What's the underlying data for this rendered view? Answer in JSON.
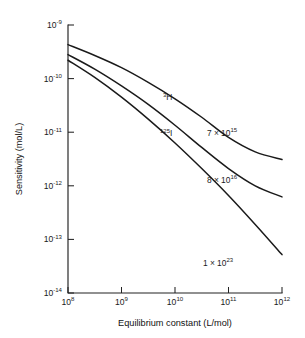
{
  "chart_data": {
    "type": "line",
    "title": "",
    "xlabel": "Equilibrium constant (L/mol)",
    "ylabel": "Sensitivity (mol/L)",
    "xscale": "log",
    "yscale": "log",
    "xlim": [
      100000000.0,
      1000000000000.0
    ],
    "ylim": [
      1e-14,
      1e-09
    ],
    "grid": false,
    "legend": "inline-annotations",
    "xticks": [
      {
        "value": 100000000.0,
        "mantissa": "10",
        "exponent": "8"
      },
      {
        "value": 1000000000.0,
        "mantissa": "10",
        "exponent": "9"
      },
      {
        "value": 10000000000.0,
        "mantissa": "10",
        "exponent": "10"
      },
      {
        "value": 100000000000.0,
        "mantissa": "10",
        "exponent": "11"
      },
      {
        "value": 1000000000000.0,
        "mantissa": "10",
        "exponent": "12"
      }
    ],
    "yticks": [
      {
        "value": 1e-09,
        "mantissa": "10",
        "exponent": "-9"
      },
      {
        "value": 1e-10,
        "mantissa": "10",
        "exponent": "-10"
      },
      {
        "value": 1e-11,
        "mantissa": "10",
        "exponent": "-11"
      },
      {
        "value": 1e-12,
        "mantissa": "10",
        "exponent": "-12"
      },
      {
        "value": 1e-13,
        "mantissa": "10",
        "exponent": "-13"
      },
      {
        "value": 1e-14,
        "mantissa": "10",
        "exponent": "-14"
      }
    ],
    "series": [
      {
        "name": "3H",
        "label_isotope_sup": "3",
        "label_isotope_el": "H",
        "specific_activity_mantissa": "7",
        "specific_activity_exponent": "15",
        "specific_activity_text": "7 × 10",
        "x": [
          100000000.0,
          316000000.0,
          1000000000.0,
          3160000000.0,
          10000000000.0,
          31600000000.0,
          100000000000.0,
          316000000000.0,
          1000000000000.0
        ],
        "y": [
          4.3e-10,
          2.7e-10,
          1.6e-10,
          8.5e-11,
          4.2e-11,
          1.9e-11,
          8e-12,
          4.3e-12,
          3.1e-12
        ]
      },
      {
        "name": "125I",
        "label_isotope_sup": "125",
        "label_isotope_el": "I",
        "specific_activity_mantissa": "8",
        "specific_activity_exponent": "16",
        "specific_activity_text": "8 × 10",
        "x": [
          100000000.0,
          316000000.0,
          1000000000.0,
          3160000000.0,
          10000000000.0,
          31600000000.0,
          100000000000.0,
          316000000000.0,
          1000000000000.0
        ],
        "y": [
          2.8e-10,
          1.5e-10,
          7.3e-11,
          3.3e-11,
          1.35e-11,
          5.2e-12,
          2.1e-12,
          1e-12,
          6.2e-13
        ]
      },
      {
        "name": "1e23",
        "label_isotope_sup": "",
        "label_isotope_el": "",
        "specific_activity_mantissa": "1",
        "specific_activity_exponent": "23",
        "specific_activity_text": "1 × 10",
        "x": [
          100000000.0,
          316000000.0,
          1000000000.0,
          3160000000.0,
          10000000000.0,
          31600000000.0,
          100000000000.0,
          316000000000.0,
          1000000000000.0
        ],
        "y": [
          2.2e-10,
          1.05e-10,
          4.5e-11,
          1.75e-11,
          6.3e-12,
          2.1e-12,
          6.6e-13,
          1.9e-13,
          5.2e-14
        ]
      }
    ],
    "annotations": [
      {
        "text": "3H",
        "kind": "isotope-label"
      },
      {
        "text": "125I",
        "kind": "isotope-label"
      },
      {
        "text": "7 × 10^15",
        "kind": "value-label"
      },
      {
        "text": "8 × 10^16",
        "kind": "value-label"
      },
      {
        "text": "1 × 10^23",
        "kind": "value-label"
      }
    ],
    "colors": {
      "curve": "#1a1a1a",
      "axis": "#222222",
      "background": "#ffffff"
    }
  }
}
